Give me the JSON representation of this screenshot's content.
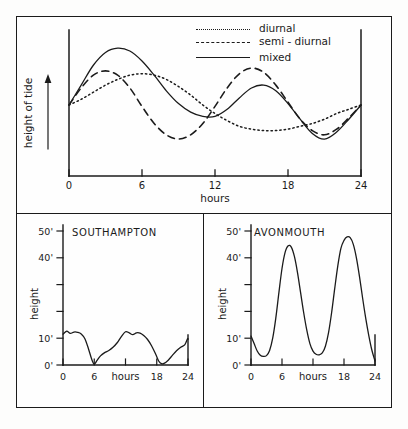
{
  "figure": {
    "background_color": "#fdfdfc",
    "ink_color": "#1b1b1b"
  },
  "panels": {
    "top": {
      "name": "tide-type-comparison",
      "y_axis_label": "height of tide",
      "x_axis_label": "hours",
      "x_ticks": [
        "0",
        "6",
        "12",
        "18",
        "24"
      ],
      "legend": [
        {
          "label": "diurnal",
          "style": "dotted"
        },
        {
          "label": "semi - diurnal",
          "style": "dashed"
        },
        {
          "label": "mixed",
          "style": "solid"
        }
      ]
    },
    "southampton": {
      "title": "SOUTHAMPTON",
      "y_axis_label": "height",
      "x_axis_label": "hours",
      "y_ticks": [
        "50'",
        "40'",
        "",
        "",
        "10'",
        "0'"
      ],
      "x_ticks": [
        "0",
        "6",
        "",
        "18",
        "24"
      ]
    },
    "avonmouth": {
      "title": "AVONMOUTH",
      "y_axis_label": "height",
      "x_axis_label": "hours",
      "y_ticks": [
        "50'",
        "40'",
        "",
        "",
        "10'",
        "0'"
      ],
      "x_ticks": [
        "0",
        "6",
        "",
        "18",
        "24"
      ]
    }
  },
  "chart_data": [
    {
      "type": "line",
      "id": "tide-types",
      "title": "",
      "xlabel": "hours",
      "ylabel": "height of tide",
      "xlim": [
        0,
        24
      ],
      "ylim": [
        0,
        100
      ],
      "grid": false,
      "legend_position": "top-right",
      "xticks": [
        0,
        6,
        12,
        18,
        24
      ],
      "xticklabels": [
        "0",
        "6",
        "12",
        "18",
        "24"
      ],
      "yticklabels": [],
      "x": [
        0,
        1,
        2,
        3,
        4,
        5,
        6,
        7,
        8,
        9,
        10,
        11,
        12,
        13,
        14,
        15,
        16,
        17,
        18,
        19,
        20,
        21,
        22,
        23,
        24
      ],
      "series": [
        {
          "name": "diurnal",
          "style": "dotted",
          "values": [
            50,
            54,
            59,
            64,
            68,
            71,
            72,
            71,
            68,
            63,
            57,
            50,
            44,
            39,
            35,
            33,
            32,
            32,
            33,
            35,
            37,
            40,
            44,
            47,
            50
          ]
        },
        {
          "name": "semi - diurnal",
          "style": "dashed",
          "values": [
            50,
            62,
            71,
            74,
            71,
            62,
            49,
            37,
            29,
            26,
            29,
            37,
            49,
            62,
            72,
            76,
            73,
            64,
            52,
            40,
            32,
            29,
            33,
            41,
            50
          ]
        },
        {
          "name": "mixed",
          "style": "solid",
          "values": [
            50,
            64,
            78,
            87,
            90,
            88,
            81,
            71,
            60,
            51,
            45,
            42,
            42,
            47,
            55,
            62,
            64,
            60,
            51,
            40,
            30,
            26,
            31,
            40,
            50
          ]
        }
      ]
    },
    {
      "type": "line",
      "id": "southampton-tide",
      "title": "SOUTHAMPTON",
      "xlabel": "hours",
      "ylabel": "height",
      "xlim": [
        0,
        24
      ],
      "ylim": [
        0,
        50
      ],
      "grid": false,
      "xticks": [
        0,
        6,
        12,
        18,
        24
      ],
      "xticklabels": [
        "0",
        "6",
        "",
        "18",
        "24"
      ],
      "yticks": [
        0,
        10,
        20,
        30,
        40,
        50
      ],
      "yticklabels": [
        "0'",
        "10'",
        "",
        "",
        "40'",
        "50'"
      ],
      "x": [
        0,
        0.7,
        1.4,
        2.1,
        2.8,
        3.5,
        4.2,
        4.9,
        5.5,
        6.0,
        6.5,
        7.2,
        8.0,
        8.8,
        9.6,
        10.4,
        11.2,
        12.0,
        12.7,
        13.4,
        14.1,
        14.8,
        15.5,
        16.2,
        17.0,
        17.8,
        18.4,
        18.9,
        19.4,
        20.2,
        21.0,
        21.8,
        22.6,
        23.4,
        23.9,
        24
      ],
      "values": [
        11.5,
        12.6,
        11.8,
        12.3,
        12.2,
        11.6,
        9.8,
        6.0,
        2.2,
        0.3,
        1.6,
        3.4,
        4.6,
        5.4,
        6.6,
        8.3,
        10.6,
        12.4,
        12.0,
        11.3,
        12.0,
        11.9,
        11.0,
        9.6,
        7.2,
        4.0,
        1.4,
        0.5,
        0.6,
        1.8,
        3.6,
        5.3,
        6.6,
        7.6,
        9.8,
        9.6
      ]
    },
    {
      "type": "line",
      "id": "avonmouth-tide",
      "title": "AVONMOUTH",
      "xlabel": "hours",
      "ylabel": "height",
      "xlim": [
        0,
        24
      ],
      "ylim": [
        0,
        50
      ],
      "grid": false,
      "xticks": [
        0,
        6,
        12,
        18,
        24
      ],
      "xticklabels": [
        "0",
        "6",
        "",
        "18",
        "24"
      ],
      "yticks": [
        0,
        10,
        20,
        30,
        40,
        50
      ],
      "yticklabels": [
        "0'",
        "10'",
        "",
        "",
        "40'",
        "50'"
      ],
      "x": [
        0,
        0.6,
        1.2,
        1.8,
        2.4,
        3.0,
        3.6,
        4.2,
        4.8,
        5.4,
        6.0,
        6.6,
        7.2,
        7.8,
        8.4,
        9.0,
        9.6,
        10.2,
        10.8,
        11.4,
        12.0,
        12.6,
        13.2,
        13.8,
        14.4,
        15.0,
        15.6,
        16.2,
        16.8,
        17.4,
        18.0,
        18.6,
        19.2,
        19.8,
        20.4,
        21.0,
        21.6,
        22.2,
        22.8,
        23.4,
        24
      ],
      "values": [
        10.8,
        8.0,
        5.2,
        3.6,
        3.2,
        3.5,
        5.4,
        10.0,
        17.5,
        27.0,
        36.0,
        42.0,
        44.5,
        44.0,
        40.5,
        34.5,
        27.0,
        19.5,
        13.0,
        8.0,
        5.2,
        4.0,
        3.8,
        4.5,
        7.0,
        12.0,
        19.5,
        28.5,
        37.0,
        43.5,
        46.5,
        47.8,
        47.5,
        45.0,
        40.0,
        33.0,
        25.0,
        17.5,
        11.0,
        5.5,
        1.5
      ]
    }
  ]
}
